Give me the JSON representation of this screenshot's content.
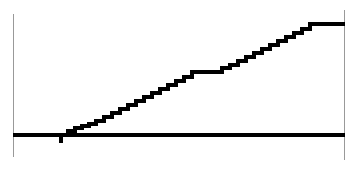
{
  "figure": {
    "width": 355,
    "height": 169,
    "background_color": "#ffffff"
  },
  "axes": {
    "left_spine": {
      "name": "left-axis-spine",
      "x": 13.5,
      "y_top": 14,
      "y_bottom": 157,
      "color": "#999999",
      "width": 1.3
    },
    "right_spine": {
      "name": "right-axis-spine",
      "x": 344.5,
      "y_top": 10,
      "y_bottom": 160,
      "color": "#999999",
      "width": 1.3
    },
    "baseline": {
      "name": "baseline-axis",
      "x_start": 13,
      "x_end": 345,
      "y": 135,
      "color": "#000000",
      "width": 3.2
    }
  },
  "chart_data": {
    "type": "line",
    "subtype": "step",
    "title": "",
    "subtitle": "",
    "xlabel": "",
    "ylabel": "",
    "xlim": [
      13,
      345
    ],
    "ylim": [
      135,
      23
    ],
    "grid": false,
    "legend": null,
    "tick_labels_x": [],
    "tick_labels_y": [],
    "line_color": "#000000",
    "line_width": 3.4,
    "step_mode": "post",
    "x": [
      61,
      61,
      68,
      68,
      75,
      75,
      82,
      82,
      89,
      89,
      96,
      96,
      104,
      104,
      112,
      112,
      120,
      120,
      128,
      128,
      136,
      136,
      144,
      144,
      152,
      152,
      160,
      160,
      168,
      168,
      176,
      176,
      184,
      184,
      192,
      192,
      222,
      222,
      230,
      230,
      238,
      238,
      246,
      246,
      254,
      254,
      262,
      262,
      270,
      270,
      278,
      278,
      286,
      286,
      294,
      294,
      302,
      302,
      310,
      310,
      345
    ],
    "y": [
      143,
      135,
      135,
      131,
      131,
      128,
      128,
      126,
      126,
      124,
      124,
      121,
      121,
      117,
      117,
      113,
      113,
      109,
      109,
      105,
      105,
      101,
      101,
      97,
      97,
      93,
      93,
      89,
      89,
      85,
      85,
      81,
      81,
      77,
      77,
      72,
      72,
      68,
      68,
      65,
      65,
      61,
      61,
      57,
      57,
      53,
      53,
      49,
      49,
      45,
      45,
      41,
      41,
      37,
      37,
      33,
      33,
      29,
      29,
      24,
      24
    ],
    "segments": [
      {
        "name": "initial-drop-block",
        "x0": 61,
        "x1": 68,
        "y0": 143,
        "y1": 135
      },
      {
        "name": "rising-staircase-lower",
        "x0": 68,
        "x1": 192,
        "y0": 135,
        "y1": 72
      },
      {
        "name": "middle-plateau",
        "x0": 192,
        "x1": 222,
        "y0": 72,
        "y1": 72
      },
      {
        "name": "rising-staircase-upper",
        "x0": 222,
        "x1": 310,
        "y0": 72,
        "y1": 24
      },
      {
        "name": "terminal-plateau",
        "x0": 310,
        "x1": 345,
        "y0": 24,
        "y1": 24
      }
    ],
    "step_count_lower": 18,
    "step_count_upper": 12,
    "plateau_x_range": [
      192,
      222
    ],
    "plateau_y": 72
  }
}
